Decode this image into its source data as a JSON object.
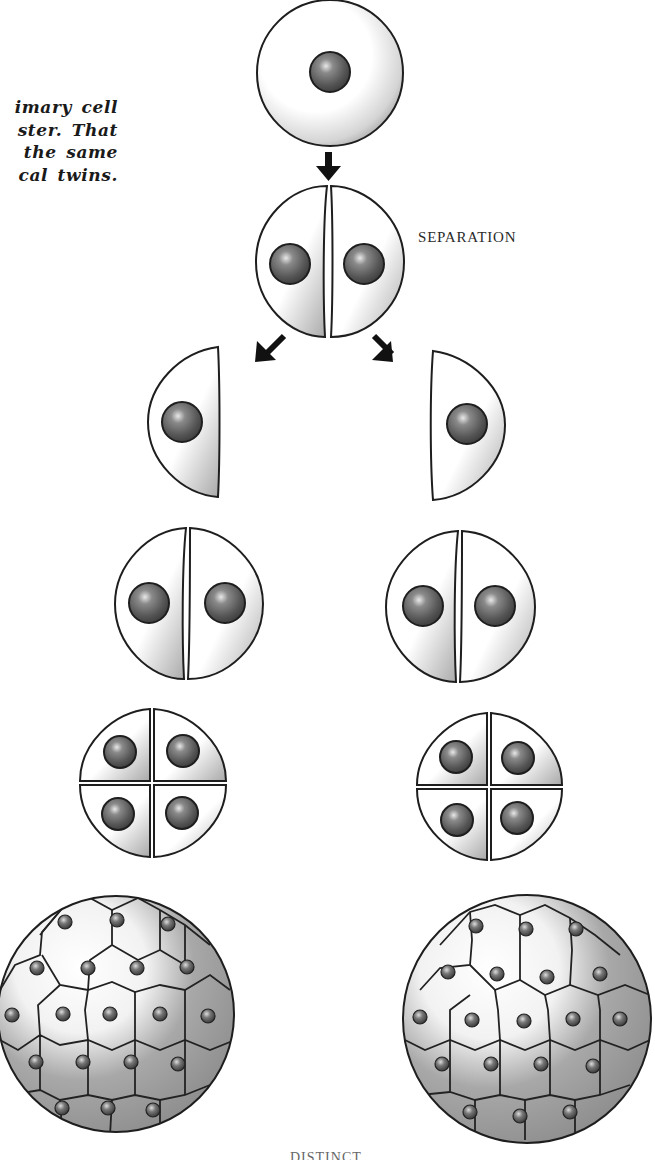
{
  "caption": {
    "lines": [
      "imary cell",
      "ster. That",
      " the same",
      "cal twins."
    ]
  },
  "labels": {
    "separation": "SEPARATION",
    "bottom_caption_clipped": "DISTINCT CELLS"
  },
  "diagram": {
    "stages": [
      {
        "name": "single-cell",
        "cells": 1
      },
      {
        "name": "two-cell",
        "cells": 2,
        "label": "SEPARATION"
      },
      {
        "name": "separated-halves",
        "branches": 2
      },
      {
        "name": "two-cell-each",
        "branches": 2,
        "cells_per_branch": 2
      },
      {
        "name": "four-cell-each",
        "branches": 2,
        "cells_per_branch": 4
      },
      {
        "name": "blastula-each",
        "branches": 2
      }
    ],
    "colors": {
      "outline": "#1e1e1e",
      "cell_fill": "#ffffff",
      "cell_shadow": "#9a9a9a",
      "nucleus": "#5a5a5a",
      "arrow": "#111111"
    }
  }
}
